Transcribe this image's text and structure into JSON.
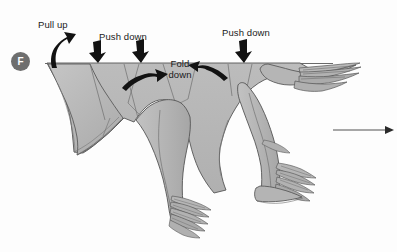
{
  "figure": {
    "step_label": "F",
    "caption_labels": [
      {
        "id": "pull-up",
        "text": "Pull up",
        "x": 38,
        "y": 19
      },
      {
        "id": "push-down-left",
        "text": "Push down",
        "x": 99,
        "y": 31
      },
      {
        "id": "fold-down",
        "text": "Fold down",
        "x": 160,
        "y": 58
      },
      {
        "id": "push-down-right",
        "text": "Push down",
        "x": 222,
        "y": 27
      }
    ],
    "colors": {
      "background": "#fdfdfd",
      "body_fill": "#b4b4b4",
      "body_fill_light": "#c6c6c6",
      "body_fill_dark": "#a3a3a3",
      "outline": "#4d4d4d",
      "arrow_black": "#121212",
      "badge_bg": "#6e6e6e",
      "badge_text": "#ffffff",
      "text": "#1a1a1a",
      "motion_arrow": "#3d3d3d"
    },
    "motion_arrow": {
      "name": "direction-of-motion-arrow",
      "x1": 333,
      "y1": 130,
      "x2": 393,
      "y2": 130,
      "direction": "right"
    },
    "annotation_arrows": [
      {
        "id": "pull-up-arrow",
        "kind": "curved-up",
        "tip_x": 60,
        "tip_y": 42
      },
      {
        "id": "push-down-arrow-left",
        "kind": "straight-down",
        "tip_x": 98,
        "tip_y": 63
      },
      {
        "id": "push-down-arrow-mid",
        "kind": "straight-down",
        "tip_x": 141,
        "tip_y": 63
      },
      {
        "id": "push-down-arrow-right",
        "kind": "straight-down",
        "tip_x": 244,
        "tip_y": 63
      },
      {
        "id": "fold-down-arrow-left",
        "kind": "curved-right",
        "tip_x": 158,
        "tip_y": 78
      },
      {
        "id": "fold-down-arrow-right",
        "kind": "curved-left",
        "tip_x": 200,
        "tip_y": 65
      }
    ],
    "horizon": {
      "y": 63,
      "x1": 45,
      "x2": 333
    }
  }
}
